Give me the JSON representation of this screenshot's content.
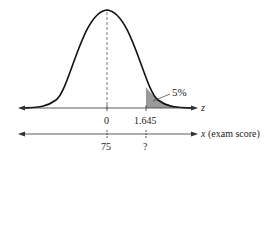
{
  "diagram": {
    "type": "normal-distribution",
    "shaded_area_label": "5%",
    "z_axis": {
      "label": "z",
      "ticks": [
        "0",
        "1.645"
      ]
    },
    "x_axis": {
      "label_var": "x",
      "label_desc": "(exam score)",
      "ticks": [
        "75",
        "?"
      ]
    },
    "colors": {
      "curve": "#111111",
      "shade": "#9a9a9a",
      "axis": "#333333"
    }
  }
}
